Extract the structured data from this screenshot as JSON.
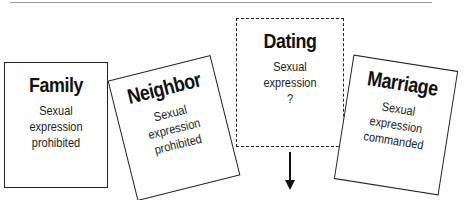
{
  "diagram": {
    "boxes": [
      {
        "id": "family",
        "title": "Family",
        "lines": [
          "Sexual",
          "expression",
          "prohibited"
        ],
        "style": "solid",
        "rotation_deg": 0
      },
      {
        "id": "neighbor",
        "title": "Neighbor",
        "lines": [
          "Sexual",
          "expression",
          "prohibited"
        ],
        "style": "solid",
        "rotation_deg": -14
      },
      {
        "id": "dating",
        "title": "Dating",
        "lines": [
          "Sexual",
          "expression",
          "?"
        ],
        "style": "dashed",
        "rotation_deg": 0
      },
      {
        "id": "marriage",
        "title": "Marriage",
        "lines": [
          "Sexual",
          "expression",
          "commanded"
        ],
        "style": "solid",
        "rotation_deg": 9
      }
    ],
    "arrow": {
      "direction": "down",
      "from": "dating"
    }
  }
}
